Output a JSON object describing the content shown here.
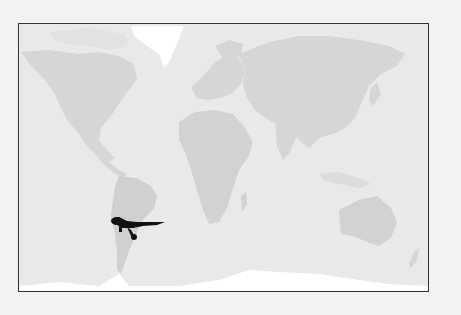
{
  "map": {
    "title": "World map",
    "projection": "equirectangular",
    "colors": {
      "background": "#f2f2f2",
      "ocean": "#e9e9e9",
      "land": "#d6d6d6",
      "ice": "#ffffff",
      "border": "#333333",
      "marker": "#111111"
    },
    "marker": {
      "type": "dinosaur-silhouette",
      "region": "South America (Argentina)"
    }
  }
}
